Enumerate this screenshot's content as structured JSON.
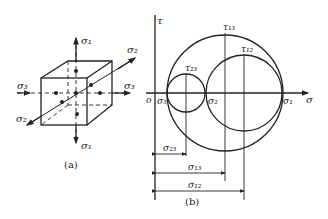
{
  "figure_a": {
    "caption": "(a)",
    "labels": {
      "s1_top": "σ₁",
      "s1_bottom": "σ₁",
      "s2_top": "σ₂",
      "s2_bottom": "σ₂",
      "s3_left": "σ₃",
      "s3_right": "σ₃"
    }
  },
  "figure_b": {
    "caption": "(b)",
    "axes": {
      "tau": "τ",
      "sigma": "σ",
      "origin": "o"
    },
    "points": {
      "s3": "σ₃",
      "s2": "σ₂",
      "s1": "σ₁"
    },
    "circles": {
      "t23": "τ₂₃",
      "t13": "τ₁₃",
      "t12": "τ₁₂"
    },
    "dimensions": {
      "d23": "σ₂₃",
      "d13": "σ₁₃",
      "d12": "σ₁₂"
    }
  },
  "colors": {
    "ink": "#222222",
    "background": "#ffffff"
  }
}
